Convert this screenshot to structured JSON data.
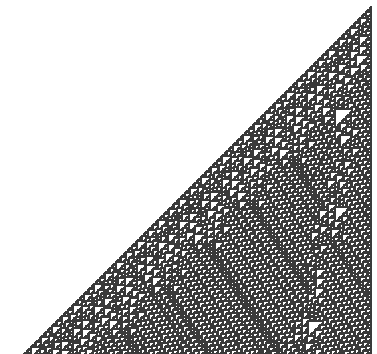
{
  "figure": {
    "type": "cellular-automaton",
    "rule": 110,
    "colors": {
      "background": "#ffffff",
      "cell": "#3a3a3a"
    },
    "generations": 262,
    "cell_size_px": 1.33,
    "origin": {
      "x": 370,
      "y": 6
    }
  }
}
